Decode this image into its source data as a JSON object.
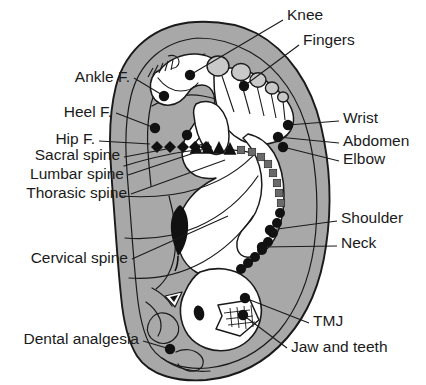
{
  "figure": {
    "background_color": "#ffffff",
    "ear_fill_color": "#a8a8a8",
    "cartilage_fill_color": "#ffffff",
    "outline_color": "#1a1a1a",
    "point_color": "#111111",
    "thoracic_marker_color": "#6a6a6a",
    "toe_fill_color": "#c9c9c9"
  },
  "labels": {
    "knee": "Knee",
    "fingers": "Fingers",
    "wrist": "Wrist",
    "abdomen": "Abdomen",
    "elbow": "Elbow",
    "shoulder": "Shoulder",
    "neck": "Neck",
    "tmj": "TMJ",
    "jaw_and_teeth": "Jaw and teeth",
    "ankle_f": "Ankle F.",
    "heel_f": "Heel F.",
    "hip_f": "Hip F.",
    "sacral_spine": "Sacral spine",
    "lumbar_spine": "Lumbar spine",
    "thorasic_spine": "Thorasic spine",
    "cervical_spine": "Cervical spine",
    "dental_analgesia": "Dental analgesia"
  },
  "label_positions": {
    "knee": {
      "x": 287,
      "y": 16,
      "anchor": "start"
    },
    "fingers": {
      "x": 303,
      "y": 41,
      "anchor": "start"
    },
    "wrist": {
      "x": 343,
      "y": 119,
      "anchor": "start"
    },
    "abdomen": {
      "x": 343,
      "y": 142,
      "anchor": "start"
    },
    "elbow": {
      "x": 343,
      "y": 160,
      "anchor": "start"
    },
    "shoulder": {
      "x": 341,
      "y": 219,
      "anchor": "start"
    },
    "neck": {
      "x": 341,
      "y": 244,
      "anchor": "start"
    },
    "tmj": {
      "x": 313,
      "y": 322,
      "anchor": "start"
    },
    "jaw_and_teeth": {
      "x": 291,
      "y": 348,
      "anchor": "start"
    },
    "ankle_f": {
      "x": 130,
      "y": 78,
      "anchor": "end"
    },
    "heel_f": {
      "x": 112,
      "y": 113,
      "anchor": "end"
    },
    "hip_f": {
      "x": 95,
      "y": 140,
      "anchor": "end"
    },
    "sacral_spine": {
      "x": 120,
      "y": 156,
      "anchor": "end"
    },
    "lumbar_spine": {
      "x": 124,
      "y": 175,
      "anchor": "end"
    },
    "thorasic_spine": {
      "x": 127,
      "y": 194,
      "anchor": "end"
    },
    "cervical_spine": {
      "x": 128,
      "y": 259,
      "anchor": "end"
    },
    "dental_analgesia": {
      "x": 139,
      "y": 340,
      "anchor": "end"
    }
  },
  "leader_lines": {
    "knee": "M 283 20 L 190 75",
    "fingers": "M 299 45 L 244 86",
    "wrist": "M 339 121 L 288 125",
    "abdomen": "M 339 143 L 278 137",
    "elbow": "M 339 161 L 283 147",
    "shoulder": "M 337 221 L 270 230",
    "neck": "M 337 246 L 262 247",
    "tmj": "M 309 323 L 245 298",
    "jaw_and_teeth": "M 287 348 L 243 315",
    "ankle_f": "M 134 78 L 164 96",
    "heel_f": "M 116 113 L 155 128",
    "hip_f": "M 99 141 L 150 144",
    "sacral_spine": "M 124 157 L 172 148",
    "lumbar_spine": "M 128 175 L 200 151",
    "thorasic_spine": "M 131 194 L 225 160",
    "cervical_spine": "M 132 259 L 228 216",
    "dental_analgesia": "M 143 341 L 170 349"
  },
  "points": [
    {
      "name": "knee",
      "x": 190,
      "y": 75,
      "r": 5.2,
      "shape": "circle"
    },
    {
      "name": "fingers",
      "x": 244,
      "y": 86,
      "r": 5.2,
      "shape": "circle"
    },
    {
      "name": "ankle-f",
      "x": 164,
      "y": 96,
      "r": 5.2,
      "shape": "circle"
    },
    {
      "name": "heel-f",
      "x": 155,
      "y": 128,
      "r": 5.2,
      "shape": "circle"
    },
    {
      "name": "hip-f",
      "x": 187,
      "y": 135,
      "r": 5.2,
      "shape": "circle"
    },
    {
      "name": "wrist",
      "x": 288,
      "y": 125,
      "r": 5.2,
      "shape": "circle"
    },
    {
      "name": "abdomen",
      "x": 278,
      "y": 137,
      "r": 5.2,
      "shape": "circle"
    },
    {
      "name": "elbow",
      "x": 283,
      "y": 147,
      "r": 5.2,
      "shape": "circle"
    },
    {
      "name": "shoulder",
      "x": 270,
      "y": 230,
      "r": 5.2,
      "shape": "circle"
    },
    {
      "name": "neck",
      "x": 262,
      "y": 247,
      "r": 5.2,
      "shape": "circle"
    },
    {
      "name": "tmj",
      "x": 245,
      "y": 298,
      "r": 5.2,
      "shape": "circle"
    },
    {
      "name": "jaw-and-teeth",
      "x": 243,
      "y": 315,
      "r": 5.2,
      "shape": "circle"
    },
    {
      "name": "dental-analgesia",
      "x": 170,
      "y": 349,
      "r": 5.2,
      "shape": "circle"
    }
  ],
  "spine_chain": {
    "sacral": {
      "marker": "diamond",
      "color": "#111111",
      "size": 6.0,
      "points": [
        {
          "x": 157,
          "y": 147
        },
        {
          "x": 170,
          "y": 147
        },
        {
          "x": 183,
          "y": 147
        },
        {
          "x": 195,
          "y": 147
        },
        {
          "x": 206,
          "y": 147
        }
      ]
    },
    "lumbar": {
      "marker": "triangle",
      "color": "#111111",
      "size": 7.0,
      "points": [
        {
          "x": 196,
          "y": 148
        },
        {
          "x": 208,
          "y": 148
        },
        {
          "x": 219,
          "y": 148
        },
        {
          "x": 230,
          "y": 149
        }
      ]
    },
    "thorasic": {
      "marker": "square",
      "color": "#6a6a6a",
      "size": 7.4,
      "points": [
        {
          "x": 241,
          "y": 150
        },
        {
          "x": 252,
          "y": 152
        },
        {
          "x": 261,
          "y": 157
        },
        {
          "x": 268,
          "y": 164
        },
        {
          "x": 273,
          "y": 173
        },
        {
          "x": 277,
          "y": 183
        },
        {
          "x": 279,
          "y": 193
        },
        {
          "x": 281,
          "y": 203
        }
      ]
    },
    "cervical": {
      "marker": "circle",
      "color": "#111111",
      "size": 5.0,
      "points": [
        {
          "x": 280,
          "y": 213
        },
        {
          "x": 277,
          "y": 223
        },
        {
          "x": 273,
          "y": 233
        },
        {
          "x": 268,
          "y": 242
        },
        {
          "x": 262,
          "y": 250
        },
        {
          "x": 255,
          "y": 257
        },
        {
          "x": 248,
          "y": 263
        },
        {
          "x": 241,
          "y": 269
        }
      ]
    }
  },
  "toes": [
    {
      "cx": 218,
      "cy": 66,
      "rx": 11,
      "ry": 10
    },
    {
      "cx": 241,
      "cy": 72,
      "rx": 9.5,
      "ry": 8.5
    },
    {
      "cx": 258,
      "cy": 80,
      "rx": 8.0,
      "ry": 7.2
    },
    {
      "cx": 272,
      "cy": 88,
      "rx": 6.6,
      "ry": 6.0
    },
    {
      "cx": 283,
      "cy": 97,
      "rx": 5.4,
      "ry": 5.0
    }
  ]
}
